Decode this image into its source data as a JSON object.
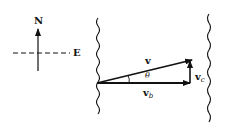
{
  "compass": {
    "north_label": "N",
    "east_label": "E"
  },
  "vectors": {
    "resultant": {
      "label": "v"
    },
    "boat": {
      "label": "v",
      "subscript": "b"
    },
    "current": {
      "label": "v",
      "subscript": "c"
    },
    "angle": {
      "label": "θ"
    }
  },
  "colors": {
    "ink": "#111111",
    "background": "#ffffff"
  }
}
